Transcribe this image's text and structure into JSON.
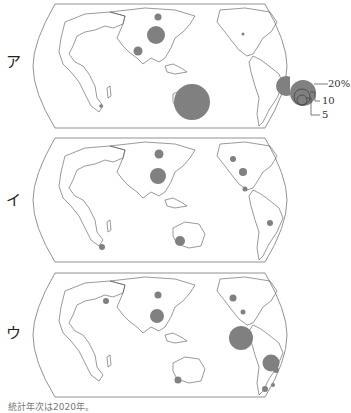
{
  "figure": {
    "panels": [
      {
        "label": "ア",
        "circles": [
          {
            "region": "East Siberia",
            "cx": 133,
            "cy": 15,
            "r": 3.5
          },
          {
            "region": "China",
            "cx": 131,
            "cy": 33,
            "r": 9
          },
          {
            "region": "India",
            "cx": 113,
            "cy": 49,
            "r": 4.5
          },
          {
            "region": "South Africa",
            "cx": 76,
            "cy": 104,
            "r": 1.8
          },
          {
            "region": "Australia",
            "cx": 167,
            "cy": 100,
            "r": 18
          },
          {
            "region": "Canada",
            "cx": 68,
            "cy": 32,
            "r": 1.5
          },
          {
            "region": "Brazil",
            "cx": 111,
            "cy": 84,
            "r": 10
          }
        ]
      },
      {
        "label": "イ",
        "circles": [
          {
            "region": "Russia",
            "cx": 134,
            "cy": 18,
            "r": 4.5
          },
          {
            "region": "China",
            "cx": 133,
            "cy": 40,
            "r": 8
          },
          {
            "region": "South Africa",
            "cx": 77,
            "cy": 111,
            "r": 3
          },
          {
            "region": "Australia",
            "cx": 155,
            "cy": 105,
            "r": 5
          },
          {
            "region": "Canada",
            "cx": 58,
            "cy": 23,
            "r": 3
          },
          {
            "region": "USA",
            "cx": 68,
            "cy": 36,
            "r": 4
          },
          {
            "region": "Mexico",
            "cx": 70,
            "cy": 53,
            "r": 2.5
          },
          {
            "region": "Bolivia",
            "cx": 95,
            "cy": 87,
            "r": 3
          }
        ]
      },
      {
        "label": "ウ",
        "circles": [
          {
            "region": "Europe",
            "cx": 81,
            "cy": 30,
            "r": 3
          },
          {
            "region": "Russia",
            "cx": 133,
            "cy": 24,
            "r": 3.5
          },
          {
            "region": "China",
            "cx": 132,
            "cy": 45,
            "r": 7
          },
          {
            "region": "Australia",
            "cx": 153,
            "cy": 109,
            "r": 3.5
          },
          {
            "region": "Canada",
            "cx": 58,
            "cy": 27,
            "r": 3.5
          },
          {
            "region": "USA",
            "cx": 68,
            "cy": 41,
            "r": 2.5
          },
          {
            "region": "Mexico",
            "cx": 66,
            "cy": 67,
            "r": 12
          },
          {
            "region": "Peru",
            "cx": 96,
            "cy": 92,
            "r": 8.5
          },
          {
            "region": "Bolivia",
            "cx": 101,
            "cy": 99,
            "r": 3
          },
          {
            "region": "Chile",
            "cx": 90,
            "cy": 118,
            "r": 3
          },
          {
            "region": "Argentina",
            "cx": 98,
            "cy": 114,
            "r": 2
          }
        ]
      }
    ],
    "legend": {
      "labels": [
        "20%",
        "10",
        "5"
      ]
    },
    "footnote": "統計年次は2020年。"
  },
  "colors": {
    "circle": "#808080",
    "land_stroke": "#555555",
    "frame_stroke": "#777777"
  }
}
